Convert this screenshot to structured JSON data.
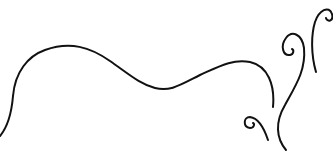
{
  "artwork": {
    "description": "decorative flourish line art",
    "background": "#ffffff",
    "stroke_color": "#111111",
    "stroke_width": 2,
    "curves": [
      {
        "name": "main-wave",
        "d": "M0,136 C10,124 12,108 13,96 C15,72 28,56 45,50 C70,41 90,47 110,61 C130,75 140,84 155,88 C170,92 180,85 200,75 C220,66 232,59 250,62 C268,66 275,85 273,107"
      },
      {
        "name": "small-spiral",
        "d": "M268,140 C264,128 258,118 250,117 C243,117 243,127 250,128 C254,128 255,124 253,123"
      },
      {
        "name": "tall-scroll",
        "d": "M286,150 C276,138 275,122 285,105 C296,85 306,70 304,48 C302,34 292,30 286,38 C280,46 283,56 290,55 C294,54 294,50 292,49"
      },
      {
        "name": "right-scroll",
        "d": "M316,72 C311,55 311,35 315,22 C319,10 329,5 332,14 C334,22 327,22 326,18"
      }
    ]
  }
}
